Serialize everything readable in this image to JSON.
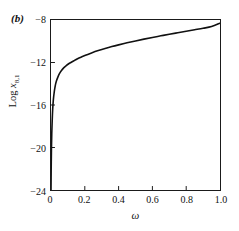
{
  "figure": {
    "panel_label": "(b)",
    "background_color": "#ffffff",
    "axis_color": "#1a1a1a",
    "curve_color": "#111111"
  },
  "chart_data": {
    "type": "line",
    "title": "",
    "subtitle": "",
    "xlabel": "ω",
    "ylabel_prefix": "Log ",
    "ylabel_var": "x",
    "ylabel_sub": "8,1",
    "ylabel": "Log x8,1",
    "xlim": [
      0.0,
      1.0
    ],
    "ylim": [
      -24,
      -8
    ],
    "xticks": [
      0,
      0.2,
      0.4,
      0.6,
      0.8,
      1.0
    ],
    "xtick_labels": [
      "0",
      "0.2",
      "0.4",
      "0.6",
      "0.8",
      "1.0"
    ],
    "yticks": [
      -8,
      -12,
      -16,
      -20,
      -24
    ],
    "ytick_labels": [
      "−8",
      "−12",
      "−16",
      "−20",
      "−24"
    ],
    "tick_direction": "in",
    "grid": false,
    "legend": null,
    "series": [
      {
        "name": "Log x8,1 vs omega",
        "x": [
          0.0,
          0.001,
          0.0025,
          0.0045,
          0.007,
          0.01,
          0.014,
          0.019,
          0.025,
          0.032,
          0.04,
          0.05,
          0.062,
          0.075,
          0.09,
          0.105,
          0.12,
          0.14,
          0.16,
          0.18,
          0.2,
          0.24,
          0.28,
          0.32,
          0.36,
          0.4,
          0.45,
          0.5,
          0.55,
          0.6,
          0.65,
          0.7,
          0.75,
          0.8,
          0.85,
          0.9,
          0.95,
          1.0
        ],
        "y": [
          -24.0,
          -22.2,
          -20.2,
          -18.7,
          -17.5,
          -16.4,
          -15.5,
          -14.8,
          -14.2,
          -13.75,
          -13.4,
          -13.05,
          -12.75,
          -12.5,
          -12.3,
          -12.12,
          -11.98,
          -11.8,
          -11.62,
          -11.48,
          -11.34,
          -11.1,
          -10.88,
          -10.68,
          -10.5,
          -10.34,
          -10.15,
          -9.97,
          -9.8,
          -9.64,
          -9.49,
          -9.34,
          -9.2,
          -9.06,
          -8.92,
          -8.78,
          -8.62,
          -8.3
        ]
      }
    ]
  }
}
